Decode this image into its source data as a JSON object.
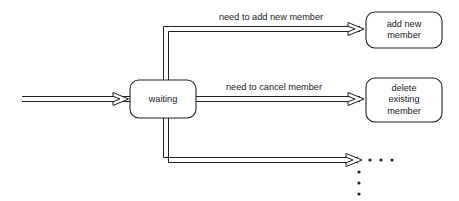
{
  "diagram": {
    "type": "state-transition-diagram",
    "background_color": "#ffffff",
    "line_color": "#231f20",
    "text_color": "#1a1a1a",
    "states": [
      {
        "id": "waiting",
        "label": "waiting",
        "lines": [
          "waiting"
        ],
        "x": 130,
        "y": 80,
        "width": 66,
        "height": 38
      },
      {
        "id": "add-new-member",
        "label": "add new member",
        "lines": [
          "add new",
          "member"
        ],
        "x": 366,
        "y": 12,
        "width": 76,
        "height": 36
      },
      {
        "id": "delete-existing-member",
        "label": "delete existing member",
        "lines": [
          "delete",
          "existing",
          "member"
        ],
        "x": 366,
        "y": 78,
        "width": 76,
        "height": 44
      }
    ],
    "transitions": [
      {
        "id": "entry",
        "label": "",
        "from": "",
        "to": "waiting"
      },
      {
        "id": "add-new-member-transition",
        "label": "need to add new member",
        "from": "waiting",
        "to": "add-new-member"
      },
      {
        "id": "cancel-member-transition",
        "label": "need to cancel member",
        "from": "waiting",
        "to": "delete-existing-member"
      },
      {
        "id": "more-transitions",
        "label": "",
        "from": "waiting",
        "to": ""
      }
    ],
    "ellipsis": {
      "horizontal_dots": 3,
      "vertical_dots": 3,
      "meaning": "additional transitions omitted"
    }
  }
}
